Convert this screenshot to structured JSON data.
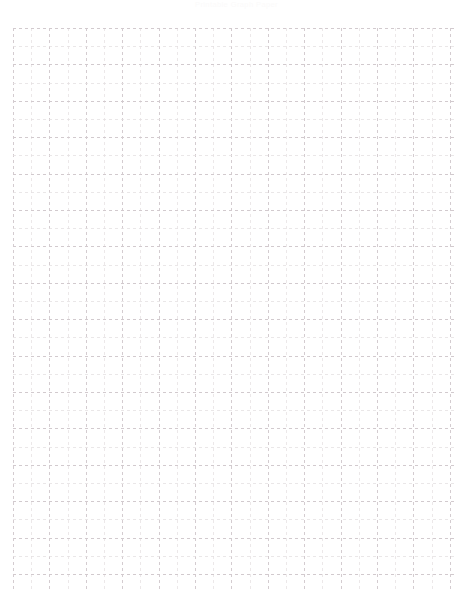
{
  "page": {
    "title": "Graph Paper",
    "width": 473,
    "height": 601,
    "background_color": "#ffffff"
  },
  "header": {
    "text": "Printable Graph Paper",
    "color": "#fbfafa",
    "visible": true
  },
  "grid": {
    "description": "Dashed graph paper grid",
    "origin_x": 13,
    "origin_y": 28,
    "end_x": 455,
    "end_y": 590,
    "cell_size": 18.2,
    "columns": 25,
    "rows": 31,
    "line_color": "#dcd6d9",
    "major_line_color": "#d2cace",
    "minor_line_color": "#e4dfe1",
    "line_width": 1,
    "dash_pattern": "3,3",
    "major_every": 2,
    "style": "dashed"
  }
}
